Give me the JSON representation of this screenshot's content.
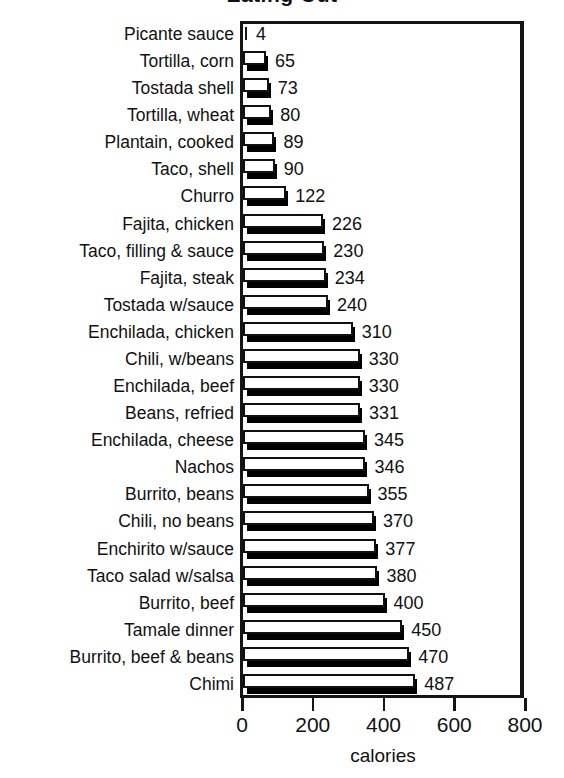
{
  "chart_data": {
    "type": "bar",
    "orientation": "horizontal",
    "title": "Eating Out",
    "xlabel": "calories",
    "ylabel": "",
    "xlim": [
      0,
      800
    ],
    "xticks": [
      0,
      200,
      400,
      600,
      800
    ],
    "xticklabels": [
      "0",
      "200",
      "400",
      "600",
      "800"
    ],
    "grid": false,
    "legend": false,
    "bar_style": "3d-shadow-white-face",
    "categories": [
      "Picante sauce",
      "Tortilla, corn",
      "Tostada shell",
      "Tortilla, wheat",
      "Plantain, cooked",
      "Taco, shell",
      "Churro",
      "Fajita, chicken",
      "Taco, filling & sauce",
      "Fajita, steak",
      "Tostada w/sauce",
      "Enchilada, chicken",
      "Chili, w/beans",
      "Enchilada, beef",
      "Beans, refried",
      "Enchilada, cheese",
      "Nachos",
      "Burrito, beans",
      "Chili, no beans",
      "Enchirito w/sauce",
      "Taco salad w/salsa",
      "Burrito, beef",
      "Tamale dinner",
      "Burrito, beef & beans",
      "Chimi"
    ],
    "values": [
      4,
      65,
      73,
      80,
      89,
      90,
      122,
      226,
      230,
      234,
      240,
      310,
      330,
      330,
      331,
      345,
      346,
      355,
      370,
      377,
      380,
      400,
      450,
      470,
      487
    ],
    "value_labels": [
      "4",
      "65",
      "73",
      "80",
      "89",
      "90",
      "122",
      "226",
      "230",
      "234",
      "240",
      "310",
      "330",
      "330",
      "331",
      "345",
      "346",
      "355",
      "370",
      "377",
      "380",
      "400",
      "450",
      "470",
      "487"
    ],
    "colors": {
      "bar_face": "#ffffff",
      "bar_outline": "#101010",
      "bar_shadow": "#000000",
      "axis": "#151515",
      "text": "#111111",
      "background": "#ffffff"
    }
  }
}
